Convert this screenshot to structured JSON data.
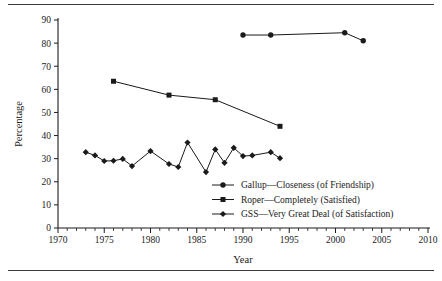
{
  "chart_data": {
    "type": "line",
    "title": "",
    "xlabel": "Year",
    "ylabel": "Percentage",
    "xlim": [
      1970,
      2010
    ],
    "ylim": [
      0,
      90
    ],
    "xticks": [
      1970,
      1975,
      1980,
      1985,
      1990,
      1995,
      2000,
      2005,
      2010
    ],
    "yticks": [
      0,
      10,
      20,
      30,
      40,
      50,
      60,
      70,
      80,
      90
    ],
    "x_minor_tick_step": 1,
    "grid": false,
    "legend_position": "center-right-inside",
    "series": [
      {
        "name": "Gallup—Closeness (of Friendship)",
        "marker": "circle",
        "color": "#1a1a1a",
        "x": [
          1990,
          1993,
          2001,
          2003
        ],
        "values": [
          83.5,
          83.5,
          84.5,
          81.0
        ]
      },
      {
        "name": "Roper—Completely (Satisfied)",
        "marker": "square",
        "color": "#1a1a1a",
        "x": [
          1976,
          1982,
          1987,
          1994
        ],
        "values": [
          63.5,
          57.5,
          55.5,
          44.0
        ]
      },
      {
        "name": "GSS—Very Great Deal (of Satisfaction)",
        "marker": "diamond",
        "color": "#1a1a1a",
        "x": [
          1973,
          1974,
          1975,
          1976,
          1977,
          1978,
          1980,
          1982,
          1983,
          1984,
          1986,
          1987,
          1988,
          1989,
          1990,
          1991,
          1993,
          1994
        ],
        "values": [
          32.8,
          31.4,
          29.0,
          29.1,
          29.9,
          26.8,
          33.3,
          27.7,
          26.4,
          37.0,
          24.2,
          34.0,
          28.2,
          34.7,
          31.1,
          31.4,
          32.8,
          30.2
        ]
      }
    ]
  },
  "axes": {
    "ylabel": "Percentage",
    "xlabel": "Year",
    "ytick_labels": [
      "0",
      "10",
      "20",
      "30",
      "40",
      "50",
      "60",
      "70",
      "80",
      "90"
    ],
    "xtick_labels": [
      "1970",
      "1975",
      "1980",
      "1985",
      "1990",
      "1995",
      "2000",
      "2005",
      "2010"
    ]
  },
  "legend": {
    "entries": [
      {
        "label": "Gallup—Closeness (of Friendship)",
        "marker": "circle"
      },
      {
        "label": "Roper—Completely (Satisfied)",
        "marker": "square"
      },
      {
        "label": "GSS—Very Great Deal (of Satisfaction)",
        "marker": "diamond"
      }
    ]
  },
  "colors": {
    "ink": "#1a1a1a",
    "line": "#3b3b3b",
    "background": "#ffffff"
  }
}
